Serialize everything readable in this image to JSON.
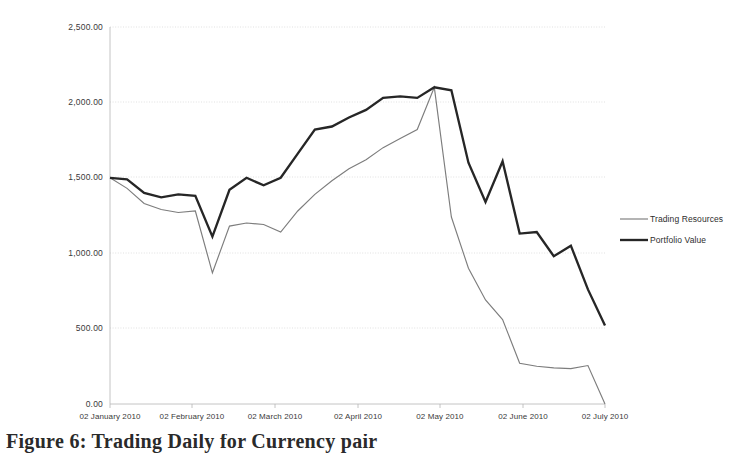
{
  "figure": {
    "caption": "Figure 6: Trading Daily for Currency pair"
  },
  "legend": {
    "position": "right",
    "items": [
      {
        "label": "Trading Resources",
        "color": "#7d7d7d",
        "style": "thin"
      },
      {
        "label": "Portfolio Value",
        "color": "#262626",
        "style": "thick"
      }
    ]
  },
  "axes": {
    "y_ticks": [
      "0.00",
      "500.00",
      "1,000.00",
      "1,500.00",
      "2,000.00",
      "2,500.00"
    ],
    "x_ticks": [
      "02 January 2010",
      "02 February 2010",
      "02 March 2010",
      "02 April 2010",
      "02 May 2010",
      "02 June 2010",
      "02 July 2010"
    ]
  },
  "chart_data": {
    "type": "line",
    "title": "",
    "xlabel": "",
    "ylabel": "",
    "ylim": [
      0,
      2500
    ],
    "grid": true,
    "legend_position": "right",
    "categories": [
      "02 January 2010",
      "09 January 2010",
      "16 January 2010",
      "23 January 2010",
      "30 January 2010",
      "02 February 2010",
      "09 February 2010",
      "16 February 2010",
      "23 February 2010",
      "02 March 2010",
      "09 March 2010",
      "16 March 2010",
      "23 March 2010",
      "30 March 2010",
      "02 April 2010",
      "09 April 2010",
      "16 April 2010",
      "23 April 2010",
      "30 April 2010",
      "02 May 2010",
      "09 May 2010",
      "16 May 2010",
      "23 May 2010",
      "30 May 2010",
      "02 June 2010",
      "09 June 2010",
      "16 June 2010",
      "23 June 2010",
      "30 June 2010",
      "02 July 2010"
    ],
    "series": [
      {
        "name": "Trading Resources",
        "color": "#7d7d7d",
        "values": [
          1500,
          1430,
          1330,
          1290,
          1270,
          1280,
          870,
          1180,
          1200,
          1190,
          1140,
          1280,
          1390,
          1480,
          1560,
          1620,
          1700,
          1760,
          1820,
          2100,
          1240,
          900,
          690,
          560,
          270,
          250,
          240,
          235,
          255,
          0
        ]
      },
      {
        "name": "Portfolio Value",
        "color": "#262626",
        "values": [
          1500,
          1490,
          1400,
          1370,
          1390,
          1380,
          1110,
          1420,
          1500,
          1450,
          1500,
          1660,
          1820,
          1840,
          1900,
          1950,
          2030,
          2040,
          2030,
          2100,
          2080,
          1600,
          1340,
          1610,
          1130,
          1140,
          980,
          1050,
          760,
          520
        ]
      }
    ]
  }
}
